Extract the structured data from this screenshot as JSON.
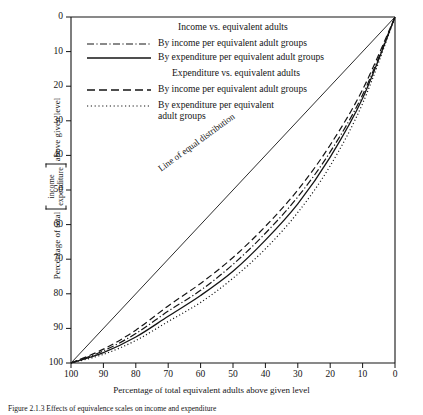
{
  "chart_data": {
    "type": "line",
    "title": "",
    "xlabel": "Percentage of total equivalent adults above given level",
    "ylabel": "Percentage of total [income/expenditure] above given level",
    "ylabel_prefix": "Percentage of total",
    "ylabel_bracket_top": "income",
    "ylabel_bracket_bottom": "expenditure",
    "ylabel_suffix": "above given level",
    "xlim": [
      100,
      0
    ],
    "ylim": [
      100,
      0
    ],
    "x_reversed": true,
    "y_reversed": true,
    "xticks": [
      100,
      90,
      80,
      70,
      60,
      50,
      40,
      30,
      20,
      10,
      0
    ],
    "yticks": [
      0,
      10,
      20,
      30,
      40,
      50,
      60,
      70,
      80,
      90,
      100
    ],
    "grid": false,
    "legend_position": "upper-center-inside",
    "annotations": [
      {
        "text": "Line of equal distribution",
        "x": 58,
        "y": 42,
        "rotation": -36
      }
    ],
    "series": [
      {
        "name": "Line of equal distribution",
        "style": "solid-thin",
        "color": "#141414",
        "in_legend": false,
        "x": [
          100,
          0
        ],
        "y": [
          100,
          0
        ]
      },
      {
        "name": "Income vs. equivalent adults — By income per equivalent adult groups",
        "style": "dash-dot",
        "color": "#141414",
        "in_legend": true,
        "x": [
          100,
          90,
          80,
          70,
          60,
          50,
          40,
          30,
          20,
          10,
          0
        ],
        "y": [
          100,
          96.5,
          91.5,
          85.0,
          79.0,
          71.5,
          62.5,
          52.0,
          39.0,
          22.5,
          0
        ]
      },
      {
        "name": "Income vs. equivalent adults — By expenditure per equivalent adult groups",
        "style": "solid",
        "color": "#141414",
        "in_legend": true,
        "x": [
          100,
          90,
          80,
          70,
          60,
          50,
          40,
          30,
          20,
          10,
          0
        ],
        "y": [
          100,
          97.0,
          92.5,
          86.5,
          80.5,
          73.5,
          64.5,
          54.0,
          40.5,
          23.5,
          0
        ]
      },
      {
        "name": "Expenditure vs. equivalent adults — By income per equivalent adult groups",
        "style": "dashed",
        "color": "#141414",
        "in_legend": true,
        "x": [
          100,
          90,
          80,
          70,
          60,
          50,
          40,
          30,
          20,
          10,
          0
        ],
        "y": [
          100,
          96.0,
          90.5,
          83.5,
          77.0,
          69.5,
          60.5,
          50.0,
          37.0,
          21.0,
          0
        ]
      },
      {
        "name": "Expenditure vs. equivalent adults — By expenditure per equivalent adult groups",
        "style": "dotted",
        "color": "#141414",
        "in_legend": true,
        "x": [
          100,
          90,
          80,
          70,
          60,
          50,
          40,
          30,
          20,
          10,
          0
        ],
        "y": [
          100,
          97.5,
          93.5,
          88.0,
          82.5,
          75.5,
          67.0,
          56.5,
          43.0,
          25.0,
          0
        ]
      }
    ]
  },
  "legend": {
    "group1_title": "Income vs. equivalent adults",
    "group1_items": [
      {
        "label": "By income per equivalent adult groups",
        "style": "dash-dot"
      },
      {
        "label": "By expenditure per equivalent adult groups",
        "style": "solid"
      }
    ],
    "group2_title": "Expenditure vs. equivalent adults",
    "group2_items": [
      {
        "label": "By income per equivalent adult groups",
        "style": "dashed"
      },
      {
        "label": "By expenditure per equivalent",
        "label2": "adult groups",
        "style": "dotted"
      }
    ]
  },
  "axes": {
    "x_title": "Percentage of total equivalent adults above given level",
    "x_tick_labels": [
      "100",
      "90",
      "80",
      "70",
      "60",
      "50",
      "40",
      "30",
      "20",
      "10",
      "0"
    ],
    "y_tick_labels": [
      "0",
      "10",
      "20",
      "30",
      "40",
      "50",
      "60",
      "70",
      "80",
      "90",
      "100"
    ]
  },
  "caption": {
    "text": "Figure 2.1.3  Effects of equivalence scales on income and expenditure"
  },
  "colors": {
    "ink": "#141414",
    "background": "#ffffff"
  }
}
